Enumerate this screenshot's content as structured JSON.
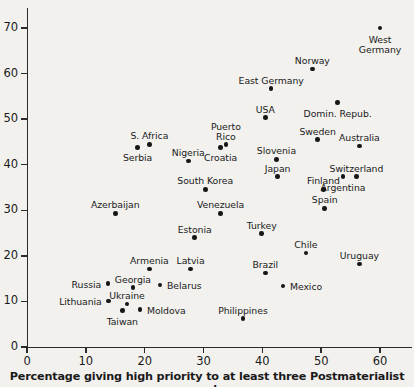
{
  "chart_data": {
    "type": "scatter",
    "title": "",
    "xlabel": "Percentage giving high priority to at least three Postmaterialist goals",
    "ylabel": "",
    "xlim": [
      0,
      65
    ],
    "ylim": [
      0,
      74
    ],
    "grid": false,
    "legend": "none",
    "xticks": [
      "0",
      "10",
      "20",
      "30",
      "40",
      "50",
      "60"
    ],
    "xtick_values": [
      0,
      10,
      20,
      30,
      40,
      50,
      60
    ],
    "yticks": [
      "0",
      "10",
      "20",
      "30",
      "40",
      "50",
      "60",
      "70"
    ],
    "ytick_values": [
      0,
      10,
      20,
      30,
      40,
      50,
      60,
      70
    ],
    "points": [
      {
        "label": "West\nGermany",
        "x": 60.0,
        "y": 70.0,
        "lx": 0,
        "ly": 7,
        "align": "center"
      },
      {
        "label": "Norway",
        "x": 48.5,
        "y": 61.0,
        "lx": 0,
        "ly": -13,
        "align": "center"
      },
      {
        "label": "East Germany",
        "x": 41.5,
        "y": 56.7,
        "lx": 0,
        "ly": -13,
        "align": "center"
      },
      {
        "label": "Domin. Repub.",
        "x": 52.8,
        "y": 53.6,
        "lx": 0,
        "ly": 6,
        "align": "center"
      },
      {
        "label": "USA",
        "x": 40.5,
        "y": 50.3,
        "lx": 0,
        "ly": -13,
        "align": "center"
      },
      {
        "label": "Sweden",
        "x": 49.4,
        "y": 45.5,
        "lx": 0,
        "ly": -13,
        "align": "center"
      },
      {
        "label": "S. Africa",
        "x": 20.8,
        "y": 44.5,
        "lx": 0,
        "ly": -13,
        "align": "center"
      },
      {
        "label": "Australia",
        "x": 56.5,
        "y": 44.1,
        "lx": 0,
        "ly": -13,
        "align": "center"
      },
      {
        "label": "Serbia",
        "x": 18.8,
        "y": 43.8,
        "lx": 0,
        "ly": 6,
        "align": "center"
      },
      {
        "label": "Puerto\nRico",
        "x": 33.8,
        "y": 44.5,
        "lx": 0,
        "ly": -22,
        "align": "center"
      },
      {
        "label": "Nigeria",
        "x": 27.4,
        "y": 40.8,
        "lx": 0,
        "ly": -13,
        "align": "center"
      },
      {
        "label": "Croatia",
        "x": 32.9,
        "y": 43.8,
        "lx": 0,
        "ly": 6,
        "align": "center"
      },
      {
        "label": "Slovenia",
        "x": 42.4,
        "y": 41.2,
        "lx": 0,
        "ly": -13,
        "align": "center"
      },
      {
        "label": "Switzerland",
        "x": 56.0,
        "y": 37.4,
        "lx": 0,
        "ly": -13,
        "align": "center"
      },
      {
        "label": "Japan",
        "x": 42.6,
        "y": 37.4,
        "lx": 0,
        "ly": -13,
        "align": "center"
      },
      {
        "label": "Argentina",
        "x": 53.7,
        "y": 37.4,
        "lx": 0,
        "ly": 6,
        "align": "center"
      },
      {
        "label": "Finland",
        "x": 50.4,
        "y": 34.6,
        "lx": 0,
        "ly": -13,
        "align": "center"
      },
      {
        "label": "South Korea",
        "x": 30.3,
        "y": 34.6,
        "lx": 0,
        "ly": -13,
        "align": "center"
      },
      {
        "label": "Spain",
        "x": 50.6,
        "y": 30.4,
        "lx": 0,
        "ly": -13,
        "align": "center"
      },
      {
        "label": "Venezuela",
        "x": 32.9,
        "y": 29.3,
        "lx": 0,
        "ly": -13,
        "align": "center"
      },
      {
        "label": "Azerbaijan",
        "x": 15.0,
        "y": 29.3,
        "lx": 0,
        "ly": -13,
        "align": "center"
      },
      {
        "label": "Estonia",
        "x": 28.5,
        "y": 24.0,
        "lx": 0,
        "ly": -13,
        "align": "center"
      },
      {
        "label": "Turkey",
        "x": 39.9,
        "y": 24.9,
        "lx": 0,
        "ly": -13,
        "align": "center"
      },
      {
        "label": "Chile",
        "x": 47.4,
        "y": 20.6,
        "lx": 0,
        "ly": -13,
        "align": "center"
      },
      {
        "label": "Uruguay",
        "x": 56.5,
        "y": 18.2,
        "lx": 0,
        "ly": -13,
        "align": "center"
      },
      {
        "label": "Brazil",
        "x": 40.5,
        "y": 16.2,
        "lx": 0,
        "ly": -13,
        "align": "center"
      },
      {
        "label": "Armenia",
        "x": 20.8,
        "y": 17.1,
        "lx": 0,
        "ly": -13,
        "align": "center"
      },
      {
        "label": "Latvia",
        "x": 27.8,
        "y": 17.1,
        "lx": 0,
        "ly": -13,
        "align": "center"
      },
      {
        "label": "Mexico",
        "x": 43.5,
        "y": 13.4,
        "lx": 7,
        "ly": -4,
        "align": "left"
      },
      {
        "label": "Belarus",
        "x": 22.6,
        "y": 13.6,
        "lx": 7,
        "ly": -4,
        "align": "left"
      },
      {
        "label": "Georgia",
        "x": 18.0,
        "y": 13.0,
        "lx": 0,
        "ly": -13,
        "align": "center"
      },
      {
        "label": "Russia",
        "x": 13.8,
        "y": 13.9,
        "lx": -7,
        "ly": -4,
        "align": "right"
      },
      {
        "label": "Ukraine",
        "x": 17.0,
        "y": 9.4,
        "lx": 0,
        "ly": -13,
        "align": "center"
      },
      {
        "label": "Lithuania",
        "x": 13.9,
        "y": 10.1,
        "lx": -7,
        "ly": -4,
        "align": "right"
      },
      {
        "label": "Moldova",
        "x": 19.2,
        "y": 8.2,
        "lx": 7,
        "ly": -4,
        "align": "left"
      },
      {
        "label": "Taiwan",
        "x": 16.2,
        "y": 8.0,
        "lx": 0,
        "ly": 6,
        "align": "center"
      },
      {
        "label": "Philippines",
        "x": 36.7,
        "y": 6.2,
        "lx": 0,
        "ly": -13,
        "align": "center"
      }
    ]
  }
}
